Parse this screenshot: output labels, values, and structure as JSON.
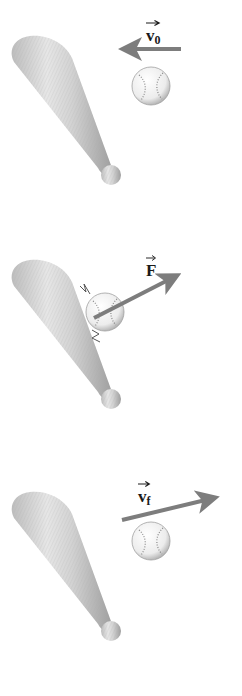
{
  "figure": {
    "colors": {
      "arrow": "#7d7d7d",
      "bat_light": "#e4e4e4",
      "bat_dark": "#9a9a9a",
      "ball": "#f4f4f4",
      "stitch": "#8a8a8a",
      "text": "#1a1a1a"
    },
    "panels": [
      {
        "id": "before",
        "vector_label": "v",
        "vector_subscript": "0",
        "arrow_direction": "left"
      },
      {
        "id": "during",
        "vector_label": "F",
        "vector_subscript": "",
        "arrow_direction": "up-right"
      },
      {
        "id": "after",
        "vector_label": "v",
        "vector_subscript": "f",
        "arrow_direction": "right, slightly up"
      }
    ]
  }
}
